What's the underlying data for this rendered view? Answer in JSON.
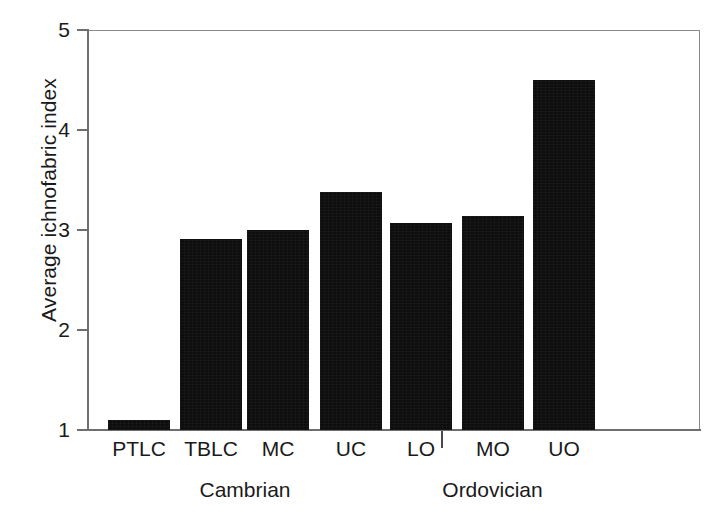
{
  "chart_data": {
    "type": "bar",
    "title": "",
    "xlabel": "",
    "ylabel": "Average ichnofabric index",
    "categories": [
      "PTLC",
      "TBLC",
      "MC",
      "UC",
      "LO",
      "MO",
      "UO"
    ],
    "values": [
      1.1,
      2.91,
      3.0,
      3.38,
      3.07,
      3.14,
      4.5
    ],
    "ylim": [
      1,
      5
    ],
    "yticks": [
      1,
      2,
      3,
      4,
      5
    ],
    "ytick_labels": [
      "1",
      "2",
      "3",
      "4",
      "5"
    ],
    "grid": false,
    "legend": "none",
    "bar_color": "#0d0d0d",
    "axis_color": "#6e6e6e",
    "groups": [
      {
        "label": "Cambrian",
        "categories": [
          "PTLC",
          "TBLC",
          "MC",
          "UC"
        ]
      },
      {
        "label": "Ordovician",
        "categories": [
          "LO",
          "MO",
          "UO"
        ]
      }
    ]
  },
  "figure": {
    "y_axis_title": "Average ichnofabric index",
    "y_ticks": [
      {
        "label": "5",
        "value": 5
      },
      {
        "label": "4",
        "value": 4
      },
      {
        "label": "3",
        "value": 3
      },
      {
        "label": "2",
        "value": 2
      },
      {
        "label": "1",
        "value": 1
      }
    ],
    "bars": [
      {
        "label": "PTLC",
        "value": 1.1
      },
      {
        "label": "TBLC",
        "value": 2.91
      },
      {
        "label": "MC",
        "value": 3.0
      },
      {
        "label": "UC",
        "value": 3.38
      },
      {
        "label": "LO",
        "value": 3.07
      },
      {
        "label": "MO",
        "value": 3.14
      },
      {
        "label": "UO",
        "value": 4.5
      }
    ],
    "group_labels": [
      {
        "label": "Cambrian"
      },
      {
        "label": "Ordovician"
      }
    ]
  }
}
